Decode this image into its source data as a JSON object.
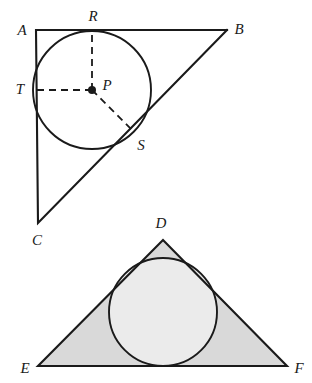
{
  "figure": {
    "background_color": "#ffffff",
    "stroke_color": "#1a1a1a",
    "triangle_fill_color": "#d9d9d9",
    "circle_fill_color": "#ebebeb",
    "upper": {
      "name": "right-triangle-with-inscribed-circle",
      "vertices": [
        {
          "label": "A",
          "x": 36,
          "y": 30,
          "label_x": 22,
          "label_y": 30
        },
        {
          "label": "B",
          "x": 227,
          "y": 30,
          "label_x": 239,
          "label_y": 29
        },
        {
          "label": "C",
          "x": 38,
          "y": 223,
          "label_x": 37,
          "label_y": 240
        }
      ],
      "circle": {
        "cx": 92,
        "cy": 90,
        "r": 59,
        "filled": false
      },
      "center_point": {
        "label": "P",
        "x": 92,
        "y": 90,
        "label_x": 107,
        "label_y": 85,
        "dot_radius": 4
      },
      "tangent_points": [
        {
          "label": "R",
          "x": 92,
          "y": 30,
          "label_x": 93,
          "label_y": 16,
          "on_side": "AB"
        },
        {
          "label": "T",
          "x": 36,
          "y": 90,
          "label_x": 20,
          "label_y": 89,
          "on_side": "AC"
        },
        {
          "label": "S",
          "x": 134,
          "y": 132,
          "label_x": 141,
          "label_y": 145,
          "on_side": "BC"
        }
      ],
      "radii_style": "dashed"
    },
    "lower": {
      "name": "shaded-triangle-with-circle",
      "vertices": [
        {
          "label": "D",
          "x": 163,
          "y": 240,
          "label_x": 161,
          "label_y": 223
        },
        {
          "label": "E",
          "x": 38,
          "y": 366,
          "label_x": 25,
          "label_y": 368
        },
        {
          "label": "F",
          "x": 287,
          "y": 366,
          "label_x": 299,
          "label_y": 368
        }
      ],
      "circle": {
        "cx": 163,
        "cy": 312,
        "r": 54,
        "filled": true
      },
      "shaded": true
    }
  }
}
